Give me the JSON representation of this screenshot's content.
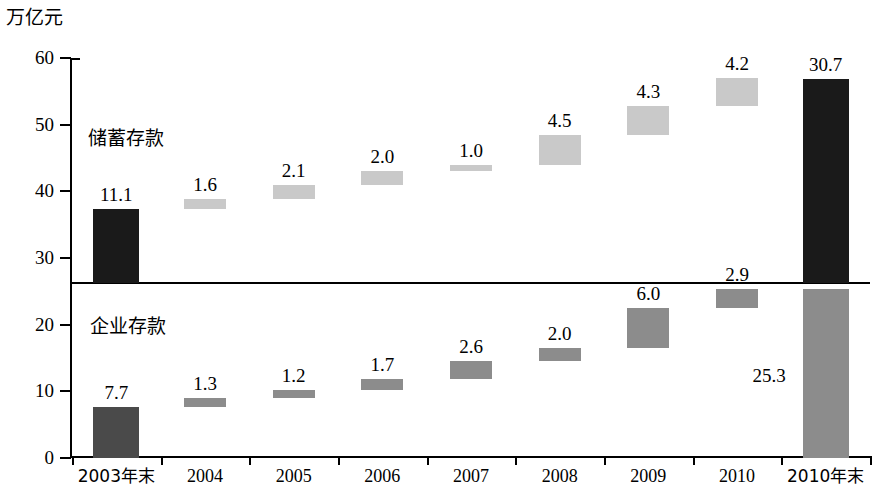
{
  "chart_data": {
    "type": "bar",
    "title": "",
    "subtitle": "",
    "ylabel": "万亿元",
    "xlabel": "",
    "ylim": [
      0,
      60
    ],
    "ytick_values": [
      0,
      10,
      20,
      30,
      40,
      50,
      60
    ],
    "ytick_labels": [
      "0",
      "10",
      "20",
      "30",
      "40",
      "50",
      "60"
    ],
    "grid": false,
    "legend_position": "inline-annotation",
    "divider_value": 26.2,
    "categories": [
      "2003年末",
      "2004",
      "2005",
      "2006",
      "2007",
      "2008",
      "2009",
      "2010",
      "2010年末"
    ],
    "annotations": [
      {
        "text": "储蓄存款",
        "panel": "upper"
      },
      {
        "text": "企业存款",
        "panel": "lower"
      }
    ],
    "series": [
      {
        "name": "储蓄存款",
        "panel": "upper",
        "values": [
          11.1,
          1.6,
          2.1,
          2.0,
          1.0,
          4.5,
          4.3,
          4.2,
          30.7
        ],
        "labels": [
          "11.1",
          "1.6",
          "2.1",
          "2.0",
          "1.0",
          "4.5",
          "4.3",
          "4.2",
          "30.7"
        ],
        "base_values": [
          26.2,
          37.3,
          38.9,
          41.0,
          43.0,
          44.0,
          48.5,
          52.8,
          26.2
        ],
        "colors": [
          "#1a1a1a",
          "#c9c9c9",
          "#c9c9c9",
          "#c9c9c9",
          "#c9c9c9",
          "#c9c9c9",
          "#c9c9c9",
          "#c9c9c9",
          "#1a1a1a"
        ]
      },
      {
        "name": "企业存款",
        "panel": "lower",
        "values": [
          7.7,
          1.3,
          1.2,
          1.7,
          2.6,
          2.0,
          6.0,
          2.9,
          25.3
        ],
        "labels": [
          "7.7",
          "1.3",
          "1.2",
          "1.7",
          "2.6",
          "2.0",
          "6.0",
          "2.9",
          "25.3"
        ],
        "base_values": [
          0.0,
          7.7,
          9.0,
          10.2,
          11.9,
          14.5,
          16.5,
          22.5,
          0.0
        ],
        "colors": [
          "#4a4a4a",
          "#8c8c8c",
          "#8c8c8c",
          "#8c8c8c",
          "#8c8c8c",
          "#8c8c8c",
          "#8c8c8c",
          "#8c8c8c",
          "#8c8c8c"
        ]
      }
    ]
  },
  "axis": {
    "unit_caption": "万亿元",
    "y_labels": [
      "60",
      "50",
      "40",
      "30",
      "20",
      "10",
      "0"
    ],
    "x_labels": [
      "2003年末",
      "2004",
      "2005",
      "2006",
      "2007",
      "2008",
      "2009",
      "2010",
      "2010年末"
    ]
  },
  "notes": {
    "upper": "储蓄存款",
    "lower": "企业存款"
  },
  "upper_labels": [
    "11.1",
    "1.6",
    "2.1",
    "2.0",
    "1.0",
    "4.5",
    "4.3",
    "4.2",
    "30.7"
  ],
  "lower_labels": [
    "7.7",
    "1.3",
    "1.2",
    "1.7",
    "2.6",
    "2.0",
    "6.0",
    "2.9",
    "25.3"
  ],
  "colors": {
    "black": "#1a1a1a",
    "mid_gray": "#8c8c8c",
    "light_gray": "#c9c9c9",
    "axis": "#000000"
  }
}
